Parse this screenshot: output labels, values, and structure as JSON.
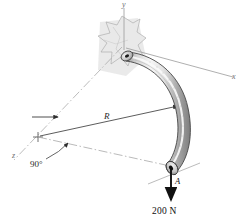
{
  "figure": {
    "background_color": "#ffffff"
  },
  "axes": {
    "y_label": "y",
    "x_label": "x",
    "z_label": "z",
    "axis_color": "#8c8c8c"
  },
  "dimensions": {
    "radius_label": "R",
    "angle_label": "90°"
  },
  "points": {
    "a_label": "A"
  },
  "load": {
    "force_label": "200 N",
    "direction": "down",
    "arrow_color": "#111111"
  },
  "colors": {
    "rod_light": "#f2f2f2",
    "rod_mid": "#c9c9c9",
    "rod_dark": "#8e8e8e",
    "rod_outline": "#4a4a4a",
    "wall_fill": "#e3e3e3",
    "wall_outline": "#9a9a9a",
    "shadow": "#dedede",
    "dim_line": "#6b6b6b",
    "centerline": "#a8a8a8"
  },
  "icons": {
    "force_arrow": "force-arrow-icon",
    "radius_arrow": "radius-arrow-icon",
    "angle_arc": "angle-arc-icon",
    "origin_cross": "origin-cross-icon",
    "leader_arrow": "leader-arrow-icon"
  }
}
